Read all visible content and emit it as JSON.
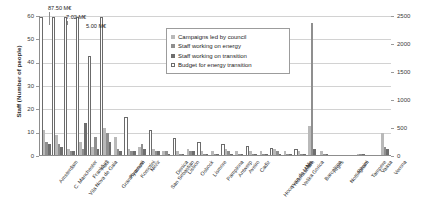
{
  "chart_data": {
    "type": "bar",
    "title": "",
    "xlabel": "",
    "ylabel": "Staff (Number of people)",
    "y2label": "Annual budget for energy transition (k€/yr)",
    "ylim": [
      0,
      60
    ],
    "y2lim": [
      0,
      2500
    ],
    "yticks": [
      "0",
      "10",
      "20",
      "30",
      "40",
      "50",
      "60"
    ],
    "y2ticks": [
      "0",
      "500",
      "1000",
      "1500",
      "2000",
      "2500"
    ],
    "grid": true,
    "legend_position": "top-center",
    "legend": [
      "Campaigns led by council",
      "Staff working on energy",
      "Staff working on transition",
      "Budget for energy transition"
    ],
    "annotations": [
      {
        "text": "87.50 M€",
        "category": "Amsterdam"
      },
      {
        "text": "7.02 M€",
        "category": "Frankfurt"
      },
      {
        "text": "5.00 M€",
        "category": "Abul"
      }
    ],
    "categories": [
      "Amsterdam",
      "C. Manchester",
      "Vila Nova de Gaia",
      "Frankfurt",
      "Abul",
      "Gran Kvarnevi",
      "Plymouth",
      "Komotini",
      "Nezir",
      "San Sebastian",
      "Denica",
      "Lisbon",
      "Osbock",
      "Lismore",
      "Pamplona",
      "Antwerp",
      "Aveiro",
      "Cadiz",
      "Hoce van de Maas",
      "Frederikshavn",
      "Velika Gorica",
      "Nis",
      "Barcelona",
      "Arges",
      "Nottingham",
      "Rimini",
      "Tampere",
      "Vaasa",
      "Verona"
    ],
    "series": [
      {
        "name": "Campaigns led by council",
        "axis": "left",
        "color": "#b9b9b9",
        "values": [
          11,
          9,
          3,
          6,
          4,
          12,
          8,
          3,
          4,
          3,
          2,
          2,
          3,
          2,
          2,
          3,
          2,
          2,
          2,
          3,
          2,
          2,
          13,
          2,
          0,
          0,
          1,
          0,
          10
        ]
      },
      {
        "name": "Staff working on energy",
        "axis": "left",
        "color": "#8f8f8f",
        "values": [
          6,
          5,
          2,
          3,
          8,
          10,
          3,
          2,
          5,
          2,
          2,
          1,
          2,
          1,
          1,
          2,
          1,
          1,
          1,
          2,
          1,
          1,
          57,
          1,
          0,
          0,
          1,
          0,
          4
        ]
      },
      {
        "name": "Staff working on transition",
        "axis": "left",
        "color": "#6e6e6e",
        "values": [
          5,
          4,
          2,
          14,
          3,
          6,
          2,
          2,
          3,
          2,
          1,
          1,
          2,
          1,
          1,
          1,
          1,
          1,
          1,
          1,
          1,
          1,
          3,
          1,
          0,
          0,
          1,
          0,
          3
        ]
      },
      {
        "name": "Budget for energy transition",
        "axis": "right",
        "color": "#ffffff",
        "values": [
          2480,
          2480,
          2480,
          2480,
          1790,
          2480,
          0,
          700,
          0,
          460,
          0,
          330,
          0,
          250,
          0,
          210,
          0,
          180,
          0,
          150,
          0,
          120,
          0,
          0,
          0,
          0,
          0,
          0,
          0
        ]
      }
    ]
  }
}
